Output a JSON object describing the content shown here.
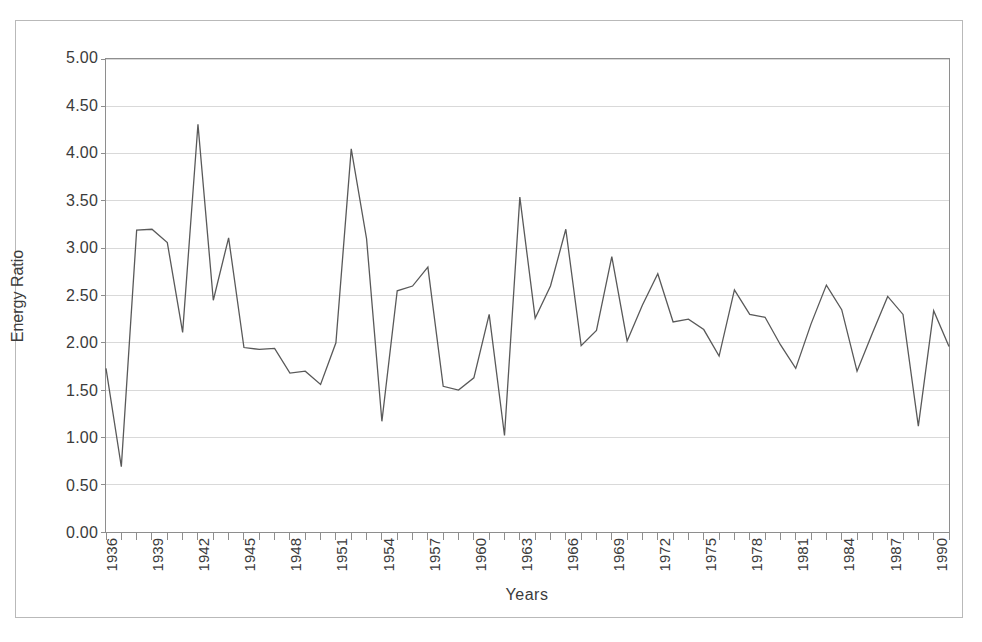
{
  "chart_data": {
    "type": "line",
    "title": "",
    "xlabel": "Years",
    "ylabel": "Energy Ratio",
    "xlim": [
      1936,
      1991
    ],
    "ylim": [
      0.0,
      5.0
    ],
    "grid": true,
    "legend": null,
    "y_ticks": [
      "0.00",
      "0.50",
      "1.00",
      "1.50",
      "2.00",
      "2.50",
      "3.00",
      "3.50",
      "4.00",
      "4.50",
      "5.00"
    ],
    "y_tick_values": [
      0.0,
      0.5,
      1.0,
      1.5,
      2.0,
      2.5,
      3.0,
      3.5,
      4.0,
      4.5,
      5.0
    ],
    "x_tick_labels": [
      "1936",
      "1939",
      "1942",
      "1945",
      "1948",
      "1951",
      "1954",
      "1957",
      "1960",
      "1963",
      "1966",
      "1969",
      "1972",
      "1975",
      "1978",
      "1981",
      "1984",
      "1987",
      "1990"
    ],
    "x_tick_values": [
      1936,
      1939,
      1942,
      1945,
      1948,
      1951,
      1954,
      1957,
      1960,
      1963,
      1966,
      1969,
      1972,
      1975,
      1978,
      1981,
      1984,
      1987,
      1990
    ],
    "x_minor_step": 1,
    "line_color": "#595959",
    "grid_color": "#d9d9d9",
    "axis_color": "#8e8e8e",
    "x": [
      1936,
      1937,
      1938,
      1939,
      1940,
      1941,
      1942,
      1943,
      1944,
      1945,
      1946,
      1947,
      1948,
      1949,
      1950,
      1951,
      1952,
      1953,
      1954,
      1955,
      1956,
      1957,
      1958,
      1959,
      1960,
      1961,
      1962,
      1963,
      1964,
      1965,
      1966,
      1967,
      1968,
      1969,
      1970,
      1971,
      1972,
      1973,
      1974,
      1975,
      1976,
      1977,
      1978,
      1979,
      1980,
      1981,
      1982,
      1983,
      1984,
      1985,
      1986,
      1987,
      1988,
      1989,
      1990,
      1991
    ],
    "values": [
      1.73,
      0.69,
      3.19,
      3.2,
      3.06,
      2.11,
      4.31,
      2.45,
      3.11,
      1.95,
      1.93,
      1.94,
      1.68,
      1.7,
      1.56,
      2.0,
      4.05,
      3.1,
      1.17,
      2.55,
      2.6,
      2.8,
      1.54,
      1.5,
      1.63,
      2.3,
      1.02,
      3.54,
      2.26,
      2.6,
      3.2,
      1.97,
      2.13,
      2.91,
      2.02,
      2.4,
      2.73,
      2.22,
      2.25,
      2.14,
      1.86,
      2.56,
      2.3,
      2.27,
      1.98,
      1.73,
      2.2,
      2.61,
      2.35,
      1.7,
      2.1,
      2.49,
      2.3,
      1.12,
      2.34,
      1.96
    ],
    "series": [
      {
        "name": "Energy Ratio",
        "values": [
          1.73,
          0.69,
          3.19,
          3.2,
          3.06,
          2.11,
          4.31,
          2.45,
          3.11,
          1.95,
          1.93,
          1.94,
          1.68,
          1.7,
          1.56,
          2.0,
          4.05,
          3.1,
          1.17,
          2.55,
          2.6,
          2.8,
          1.54,
          1.5,
          1.63,
          2.3,
          1.02,
          3.54,
          2.26,
          2.6,
          3.2,
          1.97,
          2.13,
          2.91,
          2.02,
          2.4,
          2.73,
          2.22,
          2.25,
          2.14,
          1.86,
          2.56,
          2.3,
          2.27,
          1.98,
          1.73,
          2.2,
          2.61,
          2.35,
          1.7,
          2.1,
          2.49,
          2.3,
          1.12,
          2.34,
          1.96
        ]
      }
    ]
  }
}
